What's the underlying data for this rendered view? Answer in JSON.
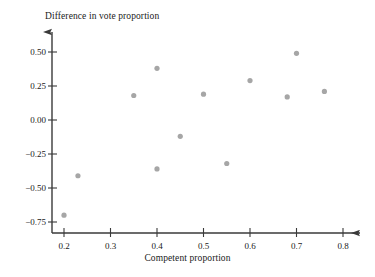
{
  "chart_data": {
    "type": "scatter",
    "title": "",
    "xlabel": "Competent proportion",
    "ylabel": "Difference in vote proportion",
    "xlim": [
      0.165,
      0.835
    ],
    "ylim": [
      -0.78,
      0.62
    ],
    "grid": false,
    "legend": "none",
    "marker": {
      "shape": "circle",
      "color": "#a6a6a6",
      "size_px": 4
    },
    "xticks": [
      0.2,
      0.3,
      0.4,
      0.5,
      0.6,
      0.7,
      0.8
    ],
    "xtick_labels": [
      "0.2",
      "0.3",
      "0.4",
      "0.5",
      "0.6",
      "0.7",
      "0.8"
    ],
    "yticks": [
      0.5,
      0.25,
      0.0,
      -0.25,
      -0.5,
      -0.75
    ],
    "ytick_labels": [
      "0.50",
      "0.25",
      "0.00",
      "−0.25",
      "−0.50",
      "−0.75"
    ],
    "x": [
      0.2,
      0.23,
      0.35,
      0.4,
      0.4,
      0.45,
      0.5,
      0.55,
      0.6,
      0.68,
      0.7,
      0.76
    ],
    "y": [
      -0.7,
      -0.41,
      0.18,
      0.38,
      -0.36,
      -0.12,
      0.19,
      -0.32,
      0.29,
      0.17,
      0.49,
      0.21
    ],
    "points": [
      {
        "x": 0.2,
        "y": -0.7
      },
      {
        "x": 0.23,
        "y": -0.41
      },
      {
        "x": 0.35,
        "y": 0.18
      },
      {
        "x": 0.4,
        "y": 0.38
      },
      {
        "x": 0.4,
        "y": -0.36
      },
      {
        "x": 0.45,
        "y": -0.12
      },
      {
        "x": 0.5,
        "y": 0.19
      },
      {
        "x": 0.55,
        "y": -0.32
      },
      {
        "x": 0.6,
        "y": 0.29
      },
      {
        "x": 0.68,
        "y": 0.17
      },
      {
        "x": 0.7,
        "y": 0.49
      },
      {
        "x": 0.76,
        "y": 0.21
      }
    ],
    "axis_style": {
      "color": "#3a3a3a",
      "arrow_heads": true,
      "spines": [
        "left",
        "bottom"
      ]
    }
  }
}
